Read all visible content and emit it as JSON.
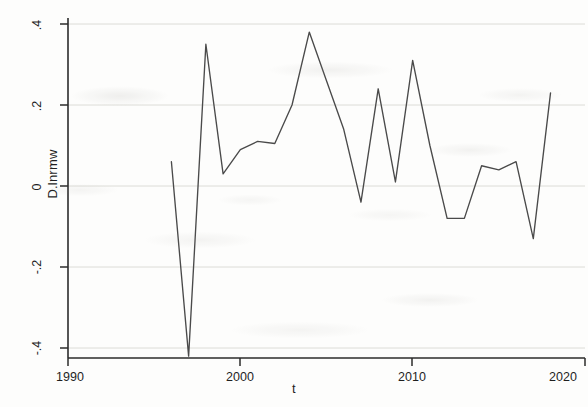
{
  "figure": {
    "background_color": "#fdfdfc",
    "line_color": "#4a4a4a",
    "axis_color": "#2b2b2b",
    "grid_color": "#d8d8d4"
  },
  "axes": {
    "x_label": "t",
    "y_label": "D.lnrmw",
    "x_ticks": [
      "1990",
      "2000",
      "2010",
      "2020"
    ],
    "y_ticks": [
      ".4",
      ".2",
      "0",
      "-.2",
      "-.4"
    ]
  },
  "chart_data": {
    "type": "line",
    "title": "",
    "xlabel": "t",
    "ylabel": "D.lnrmw",
    "xlim": [
      1990,
      2020
    ],
    "ylim": [
      -0.44,
      0.42
    ],
    "grid": true,
    "legend": "none",
    "x_tick_values": [
      1990,
      2000,
      2010,
      2020
    ],
    "y_tick_values": [
      0.4,
      0.2,
      0,
      -0.2,
      -0.4
    ],
    "series": [
      {
        "name": "D.lnrmw",
        "x": [
          1996,
          1997,
          1998,
          1999,
          2000,
          2001,
          2002,
          2003,
          2004,
          2005,
          2006,
          2007,
          2008,
          2009,
          2010,
          2011,
          2012,
          2013,
          2014,
          2015,
          2016,
          2017,
          2018
        ],
        "values": [
          0.06,
          -0.42,
          0.35,
          0.03,
          0.09,
          0.11,
          0.105,
          0.2,
          0.38,
          0.26,
          0.14,
          -0.04,
          0.24,
          0.01,
          0.31,
          0.1,
          -0.08,
          -0.08,
          0.05,
          0.04,
          0.06,
          -0.13,
          0.23
        ]
      }
    ]
  }
}
